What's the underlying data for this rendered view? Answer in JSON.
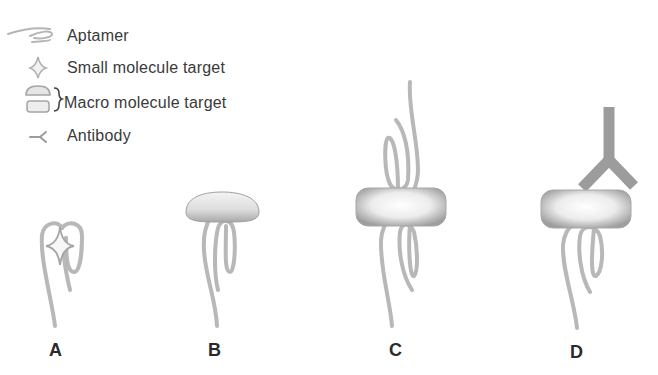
{
  "legend": {
    "items": [
      {
        "icon": "aptamer-icon",
        "label": "Aptamer"
      },
      {
        "icon": "small-molecule-icon",
        "label": "Small molecule target"
      },
      {
        "icon": "macro-molecule-icon",
        "label": "Macro molecule target"
      },
      {
        "icon": "antibody-icon",
        "label": "Antibody"
      }
    ]
  },
  "panels": [
    {
      "id": "A",
      "label": "A",
      "description": "Aptamer folded around small molecule target"
    },
    {
      "id": "B",
      "label": "B",
      "description": "Aptamer binding macro molecule target"
    },
    {
      "id": "C",
      "label": "C",
      "description": "Two aptamers sandwiching macro molecule target"
    },
    {
      "id": "D",
      "label": "D",
      "description": "Aptamer and antibody sandwiching macro molecule target"
    }
  ],
  "colors": {
    "strand": "#b8b8b8",
    "strand_dark": "#a8a8a8",
    "target_fill": "#d8d8d8",
    "target_edge": "#9a9a9a",
    "antibody": "#9c9c9c",
    "text": "#3a3a3a"
  }
}
